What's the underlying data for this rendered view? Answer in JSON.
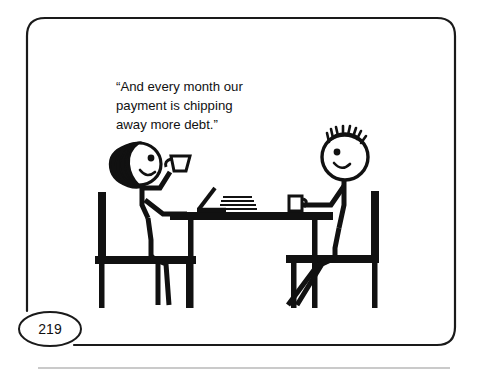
{
  "page": {
    "background_color": "#ffffff",
    "ink_color": "#111111",
    "frame": {
      "name": "cartoon-panel-frame",
      "style": "rounded-rectangle-outline",
      "stroke_color": "#1a1a1a"
    },
    "footer_rule_color": "#b9b9b9"
  },
  "page_number": {
    "label": "219",
    "badge_shape": "ellipse"
  },
  "caption": {
    "lines": [
      "“And every month our",
      "payment is chipping",
      "away more debt.”"
    ],
    "full_text": "“And every month our payment is chipping away more debt.”"
  },
  "scene": {
    "title": "two-stick-figures-at-table",
    "objects": [
      {
        "name": "left-person",
        "description": "stick figure with long dark hair holding a coffee cup, seated at left"
      },
      {
        "name": "left-chair",
        "description": "chair with vertical back post on the left"
      },
      {
        "name": "table",
        "description": "rectangular table with two legs"
      },
      {
        "name": "laptop",
        "description": "open laptop on the table"
      },
      {
        "name": "paper-stack",
        "description": "stack of papers beside the laptop"
      },
      {
        "name": "mug",
        "description": "mug on the table near the right person"
      },
      {
        "name": "right-person",
        "description": "stick figure with spiky hair reaching for a mug, seated at right"
      },
      {
        "name": "right-chair",
        "description": "chair with vertical back post on the right"
      },
      {
        "name": "coffee-cup",
        "description": "cup held up by the left person"
      }
    ]
  }
}
